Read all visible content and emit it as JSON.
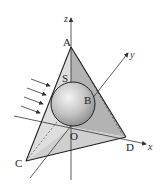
{
  "figure": {
    "points": {
      "A": "A",
      "B": "B",
      "C": "C",
      "D": "D",
      "O": "O",
      "S": "S"
    },
    "axes": {
      "x": "x",
      "y": "y",
      "z": "z"
    },
    "rays": {
      "count": 5,
      "direction": "from upper-left toward lower-right"
    },
    "colors": {
      "face_light": "#e2e2e2",
      "face_mid": "#c9c9c9",
      "face_dark": "#a9a9a9",
      "edge": "#222222",
      "sphere_highlight": "#f2f2f2",
      "sphere_shadow": "#8a8a8a"
    }
  }
}
